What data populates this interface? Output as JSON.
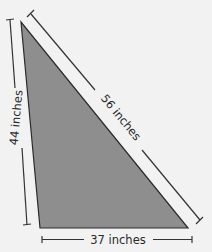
{
  "diagram": {
    "shape": "right triangle",
    "fill_color": "#8e8e8e",
    "stroke_color": "#2a2a2a",
    "background_color": "#f2f2f2",
    "labels": {
      "left_side": "44 inches",
      "hypotenuse": "56 inches",
      "bottom_side": "37 inches"
    }
  }
}
